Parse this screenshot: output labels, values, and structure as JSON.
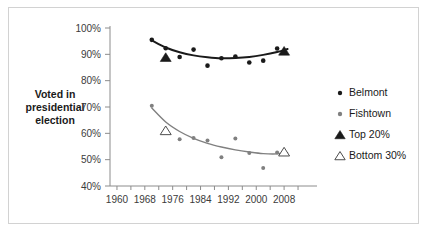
{
  "figure": {
    "border_color": "#d2d2d2",
    "background": "#ffffff"
  },
  "axis_title": {
    "line1": "Voted in",
    "line2": "presidential",
    "line3": "election"
  },
  "legend": {
    "position": "right",
    "items": [
      {
        "label": "Belmont",
        "marker": "filled-circle",
        "color": "#1a1a1a"
      },
      {
        "label": "Fishtown",
        "marker": "filled-circle",
        "color": "#808080"
      },
      {
        "label": "Top 20%",
        "marker": "filled-triangle",
        "color": "#1a1a1a"
      },
      {
        "label": "Bottom 30%",
        "marker": "open-triangle",
        "color": "#4d4d4d"
      }
    ]
  },
  "chart_data": {
    "type": "scatter",
    "title": "",
    "subtitle": "",
    "xlabel": "",
    "ylabel": "Voted in presidential election",
    "xlim": [
      1958,
      2014
    ],
    "ylim": [
      40,
      100
    ],
    "xticks": [
      1960,
      1968,
      1976,
      1984,
      1992,
      2000,
      2008
    ],
    "xtick_labels": [
      "1960",
      "1968",
      "1976",
      "1984",
      "1992",
      "2000",
      "2008"
    ],
    "xminor_step": 4,
    "yticks": [
      40,
      50,
      60,
      70,
      80,
      90,
      100
    ],
    "ytick_labels": [
      "40%",
      "50%",
      "60%",
      "70%",
      "80%",
      "90%",
      "100%"
    ],
    "grid": false,
    "series": [
      {
        "name": "Belmont",
        "marker": "filled-circle",
        "color": "#1a1a1a",
        "points": [
          {
            "x": 1970,
            "y": 95.5
          },
          {
            "x": 1974,
            "y": 92.3
          },
          {
            "x": 1978,
            "y": 89.0
          },
          {
            "x": 1982,
            "y": 91.8
          },
          {
            "x": 1986,
            "y": 85.7
          },
          {
            "x": 1990,
            "y": 88.5
          },
          {
            "x": 1994,
            "y": 89.2
          },
          {
            "x": 1998,
            "y": 86.9
          },
          {
            "x": 2002,
            "y": 87.6
          },
          {
            "x": 2006,
            "y": 92.2
          }
        ]
      },
      {
        "name": "Fishtown",
        "marker": "filled-circle",
        "color": "#808080",
        "points": [
          {
            "x": 1970,
            "y": 70.5
          },
          {
            "x": 1978,
            "y": 57.8
          },
          {
            "x": 1982,
            "y": 58.2
          },
          {
            "x": 1986,
            "y": 57.3
          },
          {
            "x": 1990,
            "y": 50.9
          },
          {
            "x": 1994,
            "y": 58.0
          },
          {
            "x": 1998,
            "y": 52.5
          },
          {
            "x": 2002,
            "y": 46.8
          },
          {
            "x": 2006,
            "y": 52.7
          }
        ]
      },
      {
        "name": "Top 20%",
        "marker": "filled-triangle",
        "color": "#1a1a1a",
        "points": [
          {
            "x": 1974,
            "y": 88.8
          },
          {
            "x": 2008,
            "y": 91.2
          }
        ]
      },
      {
        "name": "Bottom 30%",
        "marker": "open-triangle",
        "color": "#4d4d4d",
        "points": [
          {
            "x": 1974,
            "y": 61.0
          },
          {
            "x": 2008,
            "y": 52.9
          }
        ]
      }
    ],
    "trendlines": [
      {
        "name": "Belmont trend",
        "color": "#1a1a1a",
        "width": 2,
        "points": [
          {
            "x": 1970,
            "y": 95.3
          },
          {
            "x": 1974,
            "y": 92.6
          },
          {
            "x": 1978,
            "y": 90.8
          },
          {
            "x": 1982,
            "y": 89.6
          },
          {
            "x": 1986,
            "y": 88.9
          },
          {
            "x": 1990,
            "y": 88.5
          },
          {
            "x": 1994,
            "y": 88.6
          },
          {
            "x": 1998,
            "y": 89.0
          },
          {
            "x": 2002,
            "y": 89.8
          },
          {
            "x": 2006,
            "y": 90.9
          },
          {
            "x": 2009,
            "y": 92.0
          }
        ]
      },
      {
        "name": "Fishtown trend",
        "color": "#808080",
        "width": 1.4,
        "points": [
          {
            "x": 1970,
            "y": 69.6
          },
          {
            "x": 1974,
            "y": 64.3
          },
          {
            "x": 1978,
            "y": 60.7
          },
          {
            "x": 1982,
            "y": 58.1
          },
          {
            "x": 1986,
            "y": 56.2
          },
          {
            "x": 1990,
            "y": 54.8
          },
          {
            "x": 1994,
            "y": 53.7
          },
          {
            "x": 1998,
            "y": 52.9
          },
          {
            "x": 2002,
            "y": 52.3
          },
          {
            "x": 2006,
            "y": 52.2
          },
          {
            "x": 2009,
            "y": 52.6
          }
        ]
      }
    ]
  }
}
